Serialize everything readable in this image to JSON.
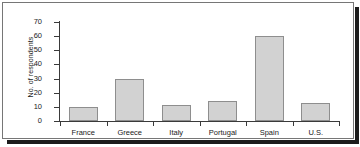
{
  "chart_data": {
    "type": "bar",
    "title": "",
    "subtitle": "",
    "xlabel": "",
    "ylabel": "No. of respondents",
    "categories": [
      "France",
      "Greece",
      "Italy",
      "Portugal",
      "Spain",
      "U.S."
    ],
    "values": [
      10,
      30,
      11,
      14,
      60,
      13
    ],
    "series": [
      {
        "name": "No. of respondents",
        "values": [
          10,
          30,
          11,
          14,
          60,
          13
        ]
      }
    ],
    "ylim": [
      0,
      70
    ],
    "ytick_values": [
      0,
      10,
      20,
      30,
      40,
      50,
      60,
      70
    ],
    "ytick_labels": [
      "0",
      "10",
      "20",
      "30",
      "40",
      "50",
      "60",
      "70"
    ],
    "grid": false,
    "legend": false,
    "legend_position": "none",
    "annotations": [],
    "bar_fill_color": "#d2d2d2",
    "bar_border_color": "#8e8e8e",
    "axis_color": "#3a3a3a",
    "frame_color": "#767676",
    "shadow_color": "#1c1c1c",
    "background_color": "#ffffff"
  }
}
